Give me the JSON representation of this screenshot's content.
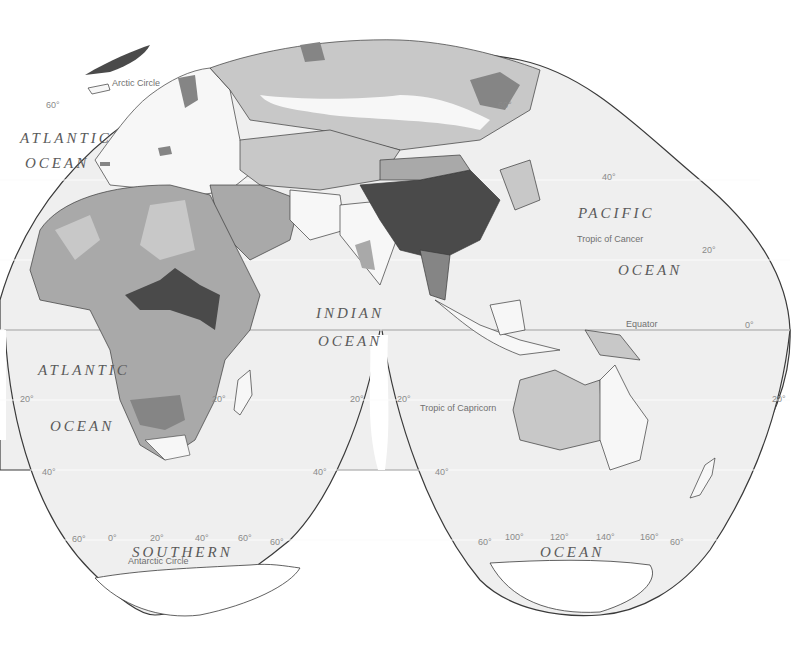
{
  "map": {
    "projection": "interrupted homolosine",
    "legend_shades": {
      "ocean": "#efefef",
      "land_light": "#f7f7f7",
      "shade_1": "#c8c8c8",
      "shade_2": "#a9a9a9",
      "shade_3": "#858585",
      "shade_4": "#4a4a4a",
      "outline": "#3a3a3a"
    },
    "oceans": {
      "atlantic_north_1": "ATLANTIC",
      "atlantic_north_2": "OCEAN",
      "atlantic_south_1": "ATLANTIC",
      "atlantic_south_2": "OCEAN",
      "indian_1": "INDIAN",
      "indian_2": "OCEAN",
      "pacific_1": "PACIFIC",
      "pacific_2": "OCEAN",
      "southern_1": "SOUTHERN",
      "southern_2": "OCEAN"
    },
    "reference_lines": {
      "arctic_circle": "Arctic Circle",
      "tropic_of_cancer": "Tropic of Cancer",
      "equator": "Equator",
      "tropic_of_capricorn": "Tropic of Capricorn",
      "antarctic_circle": "Antarctic Circle"
    },
    "degree_labels": {
      "lat_60_nw": "60°",
      "lat_40_nw": "40°",
      "lat_60_ne": "60°",
      "lat_40_ne": "40°",
      "lat_20_ne": "20°",
      "lat_0_e": "0°",
      "lat_20_sw": "20°",
      "lat_20_africa_e": "20°",
      "lat_20_indian_w": "20°",
      "lat_20_indian_e": "20°",
      "lat_20_se": "20°",
      "lat_40_sw": "40°",
      "lat_40_sm": "40°",
      "lat_40_smr": "40°",
      "lat_60_sw": "60°",
      "lon_0": "0°",
      "lon_20": "20°",
      "lon_40": "40°",
      "lon_60": "60°",
      "lat_60_sm": "60°",
      "lat_60_sml": "60°",
      "lon_100": "100°",
      "lon_120": "120°",
      "lon_140": "140°",
      "lon_160": "160°",
      "lat_60_se": "60°"
    }
  }
}
